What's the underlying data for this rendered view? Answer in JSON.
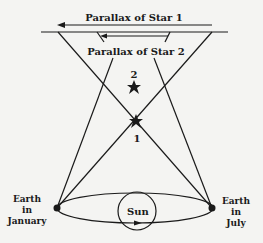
{
  "diagram": {
    "labels": {
      "parallax_star1": "Parallax of Star 1",
      "parallax_star2": "Parallax of Star 2",
      "star2_number": "2",
      "star1_number": "1",
      "sun": "Sun",
      "earth_january": [
        "Earth",
        "in",
        "January"
      ],
      "earth_july": [
        "Earth",
        "in",
        "July"
      ]
    },
    "colors": {
      "background": "#f4f4f2",
      "ink": "#1a1a1a"
    }
  }
}
